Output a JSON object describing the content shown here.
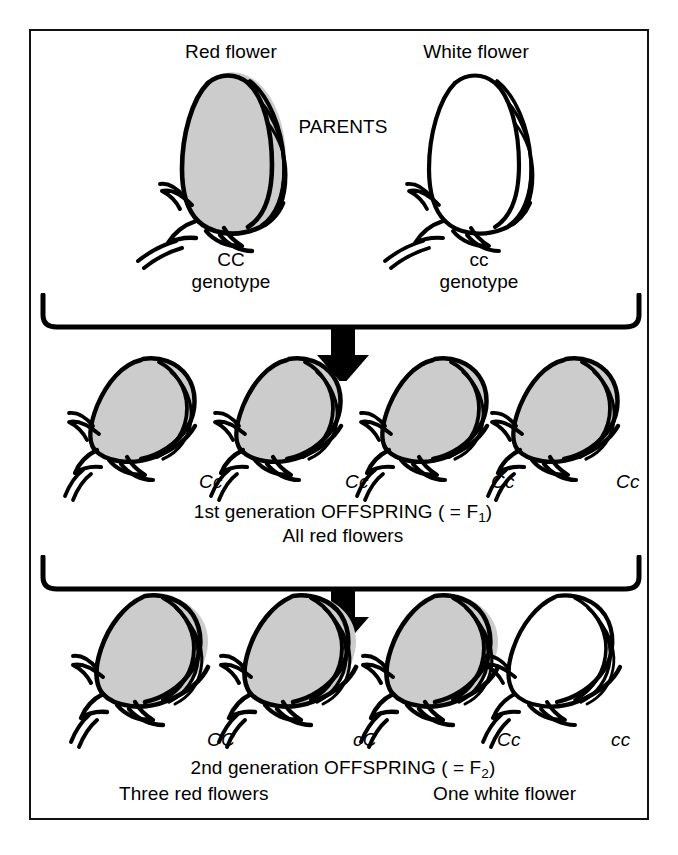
{
  "figure": {
    "title_parents": "PARENTS",
    "parents": [
      {
        "name": "Red flower",
        "genotype": "CC",
        "genotype_caption": "genotype",
        "color": "red"
      },
      {
        "name": "White flower",
        "genotype": "cc",
        "genotype_caption": "genotype",
        "color": "white"
      }
    ],
    "f1": {
      "caption_line1_prefix": "1st generation OFFSPRING ( = F",
      "caption_line1_sub": "1",
      "caption_line1_suffix": ")",
      "caption_line2": "All red flowers",
      "offspring": [
        {
          "genotype": "Cc",
          "color": "red"
        },
        {
          "genotype": "Cc",
          "color": "red"
        },
        {
          "genotype": "Cc",
          "color": "red"
        },
        {
          "genotype": "Cc",
          "color": "red"
        }
      ]
    },
    "f2": {
      "caption_line1_prefix": "2nd generation OFFSPRING ( = F",
      "caption_line1_sub": "2",
      "caption_line1_suffix": ")",
      "caption_left": "Three red flowers",
      "caption_right": "One white flower",
      "offspring": [
        {
          "genotype": "CC",
          "color": "red"
        },
        {
          "genotype": "cC",
          "color": "red"
        },
        {
          "genotype": "Cc",
          "color": "red"
        },
        {
          "genotype": "cc",
          "color": "white"
        }
      ]
    },
    "colors": {
      "ink": "#000000",
      "red_flower_fill": "#cccccc",
      "white_flower_fill": "#ffffff",
      "border": "#111111"
    }
  }
}
